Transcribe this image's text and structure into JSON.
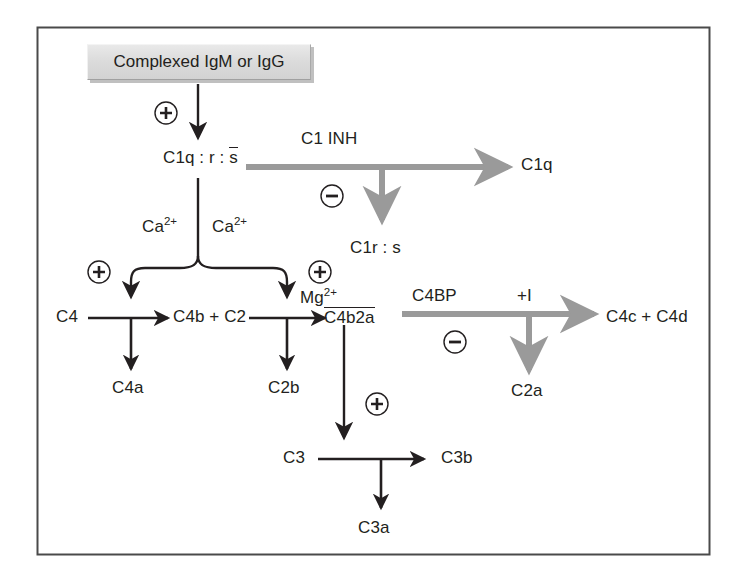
{
  "figure": {
    "type": "biochemical-pathway-diagram",
    "frame": {
      "x": 37,
      "y": 27,
      "width": 673,
      "height": 528,
      "border_color": "#4a4a4a"
    },
    "colors": {
      "activation_arrow": "#231f20",
      "inhibition_arrow": "#9a9a9a",
      "box_fill": "#dcdcdc",
      "box_shadow": "#c0c0c0",
      "text": "#231f20",
      "frame": "#4a4a4a"
    }
  },
  "nodes": {
    "complex": {
      "label": "Complexed IgM or IgG"
    },
    "c1qrs": {
      "label_pre": "C1q : r : ",
      "label_overline": "s"
    },
    "c1q": {
      "label": "C1q"
    },
    "c1rs": {
      "label": "C1r : s"
    },
    "c4": {
      "label": "C4"
    },
    "c4a": {
      "label": "C4a"
    },
    "c4b_c2": {
      "label": "C4b + C2"
    },
    "c2b": {
      "label": "C2b"
    },
    "c4b2a": {
      "label": "C4b2a"
    },
    "c2a": {
      "label": "C2a"
    },
    "c4c_c4d": {
      "label": "C4c + C4d"
    },
    "c3": {
      "label": "C3"
    },
    "c3a": {
      "label": "C3a"
    },
    "c3b": {
      "label": "C3b"
    }
  },
  "cofactors": {
    "ca_left": {
      "base": "Ca",
      "sup": "2+"
    },
    "ca_right": {
      "base": "Ca",
      "sup": "2+"
    },
    "mg": {
      "base": "Mg",
      "sup": "2+"
    }
  },
  "inhibitors": {
    "c1inh": {
      "label": "C1 INH"
    },
    "c4bp": {
      "label": "C4BP"
    },
    "factor_i": {
      "label": "+I"
    }
  },
  "signs": {
    "plus": "+",
    "minus": "–",
    "plus_box_to_c1": "+",
    "plus_ca_left": "+",
    "plus_ca_right": "+",
    "plus_c4b2a_to_c3": "+",
    "minus_c1inh": "–",
    "minus_c4bp": "–"
  }
}
